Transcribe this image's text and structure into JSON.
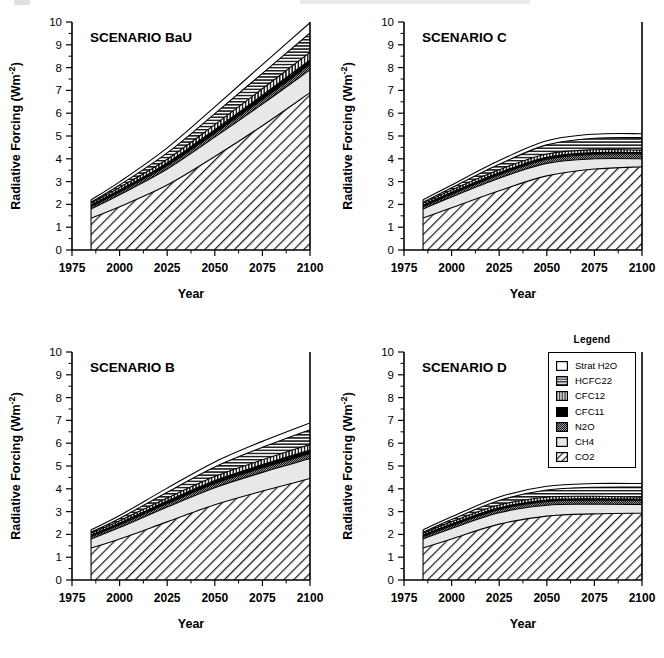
{
  "figure": {
    "background": "#ffffff",
    "width": 664,
    "height": 658
  },
  "legend": {
    "title": "Legend",
    "items": [
      {
        "label": "Strat H2O",
        "pattern": "solid-white",
        "color": "#ffffff"
      },
      {
        "label": "HCFC22",
        "pattern": "horizontal-lines",
        "color": "#555555"
      },
      {
        "label": "CFC12",
        "pattern": "vertical-lines",
        "color": "#555555"
      },
      {
        "label": "CFC11",
        "pattern": "solid-black",
        "color": "#000000"
      },
      {
        "label": "N2O",
        "pattern": "dark-stipple",
        "color": "#666666"
      },
      {
        "label": "CH4",
        "pattern": "light-gray",
        "color": "#e3e3e3"
      },
      {
        "label": "CO2",
        "pattern": "diagonal-hatch",
        "color": "#555555"
      }
    ]
  },
  "axes": {
    "xlabel": "Year",
    "ylabel_plain": "Radiative Forcing (Wm-2)",
    "ylabel_main": "Radiative  Forcing   (Wm",
    "ylabel_sup": "-2",
    "ylabel_tail": ")",
    "xticks": [
      "1975",
      "2000",
      "2025",
      "2050",
      "2075",
      "2100"
    ],
    "xtick_values": [
      1975,
      2000,
      2025,
      2050,
      2075,
      2100
    ],
    "yticks": [
      "0",
      "1",
      "2",
      "3",
      "4",
      "5",
      "6",
      "7",
      "8",
      "9",
      "10"
    ],
    "ytick_values": [
      0,
      1,
      2,
      3,
      4,
      5,
      6,
      7,
      8,
      9,
      10
    ],
    "xlim": [
      1975,
      2100
    ],
    "ylim": [
      0,
      10
    ],
    "grid": false
  },
  "chart_data": {
    "type": "area",
    "xlabel": "Year",
    "ylabel": "Radiative Forcing (Wm-2)",
    "xlim": [
      1975,
      2100
    ],
    "ylim": [
      0,
      10
    ],
    "grid": false,
    "legend_position": "outside-right-middle",
    "stack_order_bottom_to_top": [
      "CO2",
      "CH4",
      "N2O",
      "CFC11",
      "CFC12",
      "HCFC22",
      "Strat H2O"
    ],
    "x": [
      1985,
      2000,
      2025,
      2050,
      2075,
      2100
    ],
    "panels": [
      {
        "title": "SCENARIO BaU",
        "position": "top-left",
        "series": [
          {
            "name": "CO2",
            "values": [
              1.4,
              1.9,
              2.85,
              4.1,
              5.45,
              6.9
            ]
          },
          {
            "name": "CH4",
            "values": [
              0.4,
              0.52,
              0.7,
              0.85,
              0.95,
              1.0
            ]
          },
          {
            "name": "N2O",
            "values": [
              0.1,
              0.12,
              0.15,
              0.18,
              0.21,
              0.24
            ]
          },
          {
            "name": "CFC11",
            "values": [
              0.07,
              0.09,
              0.12,
              0.15,
              0.18,
              0.2
            ]
          },
          {
            "name": "CFC12",
            "values": [
              0.08,
              0.11,
              0.16,
              0.22,
              0.28,
              0.33
            ]
          },
          {
            "name": "HCFC22",
            "values": [
              0.05,
              0.11,
              0.28,
              0.48,
              0.68,
              0.85
            ]
          },
          {
            "name": "Strat H2O",
            "values": [
              0.1,
              0.14,
              0.22,
              0.3,
              0.38,
              0.45
            ]
          }
        ],
        "totals": [
          2.2,
          2.99,
          4.48,
          6.28,
          8.13,
          9.97
        ]
      },
      {
        "title": "SCENARIO C",
        "position": "top-right",
        "series": [
          {
            "name": "CO2",
            "values": [
              1.4,
              1.85,
              2.6,
              3.25,
              3.55,
              3.65
            ]
          },
          {
            "name": "CH4",
            "values": [
              0.4,
              0.48,
              0.55,
              0.55,
              0.45,
              0.35
            ]
          },
          {
            "name": "N2O",
            "values": [
              0.1,
              0.12,
              0.15,
              0.18,
              0.2,
              0.22
            ]
          },
          {
            "name": "CFC11",
            "values": [
              0.07,
              0.08,
              0.09,
              0.09,
              0.07,
              0.05
            ]
          },
          {
            "name": "CFC12",
            "values": [
              0.08,
              0.1,
              0.13,
              0.14,
              0.13,
              0.11
            ]
          },
          {
            "name": "HCFC22",
            "values": [
              0.05,
              0.1,
              0.24,
              0.4,
              0.5,
              0.55
            ]
          },
          {
            "name": "Strat H2O",
            "values": [
              0.1,
              0.12,
              0.16,
              0.18,
              0.18,
              0.17
            ]
          }
        ],
        "totals": [
          2.2,
          2.85,
          3.92,
          4.79,
          5.08,
          5.1
        ]
      },
      {
        "title": "SCENARIO B",
        "position": "bottom-left",
        "series": [
          {
            "name": "CO2",
            "values": [
              1.4,
              1.8,
              2.55,
              3.3,
              3.9,
              4.45
            ]
          },
          {
            "name": "CH4",
            "values": [
              0.4,
              0.5,
              0.65,
              0.75,
              0.82,
              0.88
            ]
          },
          {
            "name": "N2O",
            "values": [
              0.1,
              0.12,
              0.15,
              0.18,
              0.2,
              0.22
            ]
          },
          {
            "name": "CFC11",
            "values": [
              0.07,
              0.08,
              0.11,
              0.13,
              0.14,
              0.15
            ]
          },
          {
            "name": "CFC12",
            "values": [
              0.08,
              0.1,
              0.14,
              0.18,
              0.21,
              0.24
            ]
          },
          {
            "name": "HCFC22",
            "values": [
              0.05,
              0.1,
              0.25,
              0.42,
              0.55,
              0.65
            ]
          },
          {
            "name": "Strat H2O",
            "values": [
              0.1,
              0.13,
              0.18,
              0.22,
              0.26,
              0.3
            ]
          }
        ],
        "totals": [
          2.2,
          2.83,
          4.03,
          5.18,
          6.08,
          6.89
        ]
      },
      {
        "title": "SCENARIO D",
        "position": "bottom-right",
        "series": [
          {
            "name": "CO2",
            "values": [
              1.4,
              1.8,
              2.45,
              2.8,
              2.9,
              2.93
            ]
          },
          {
            "name": "CH4",
            "values": [
              0.4,
              0.46,
              0.5,
              0.48,
              0.42,
              0.38
            ]
          },
          {
            "name": "N2O",
            "values": [
              0.1,
              0.12,
              0.14,
              0.16,
              0.18,
              0.19
            ]
          },
          {
            "name": "CFC11",
            "values": [
              0.07,
              0.08,
              0.08,
              0.07,
              0.06,
              0.04
            ]
          },
          {
            "name": "CFC12",
            "values": [
              0.08,
              0.1,
              0.12,
              0.12,
              0.11,
              0.09
            ]
          },
          {
            "name": "HCFC22",
            "values": [
              0.05,
              0.09,
              0.2,
              0.32,
              0.4,
              0.45
            ]
          },
          {
            "name": "Strat H2O",
            "values": [
              0.1,
              0.12,
              0.15,
              0.16,
              0.16,
              0.15
            ]
          }
        ],
        "totals": [
          2.2,
          2.77,
          3.64,
          4.11,
          4.23,
          4.23
        ]
      }
    ]
  }
}
